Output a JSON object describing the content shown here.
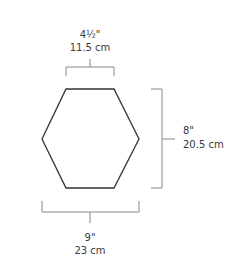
{
  "shape": {
    "type": "hexagon",
    "stroke_color": "#333333",
    "fill_color": "#ffffff"
  },
  "dimensions": {
    "top": {
      "imperial": "4½\"",
      "metric": "11.5 cm"
    },
    "right": {
      "imperial": "8\"",
      "metric": "20.5 cm"
    },
    "bottom": {
      "imperial": "9\"",
      "metric": "23 cm"
    }
  },
  "colors": {
    "bracket": "#8a8a8a",
    "text": "#3a3a3a"
  }
}
